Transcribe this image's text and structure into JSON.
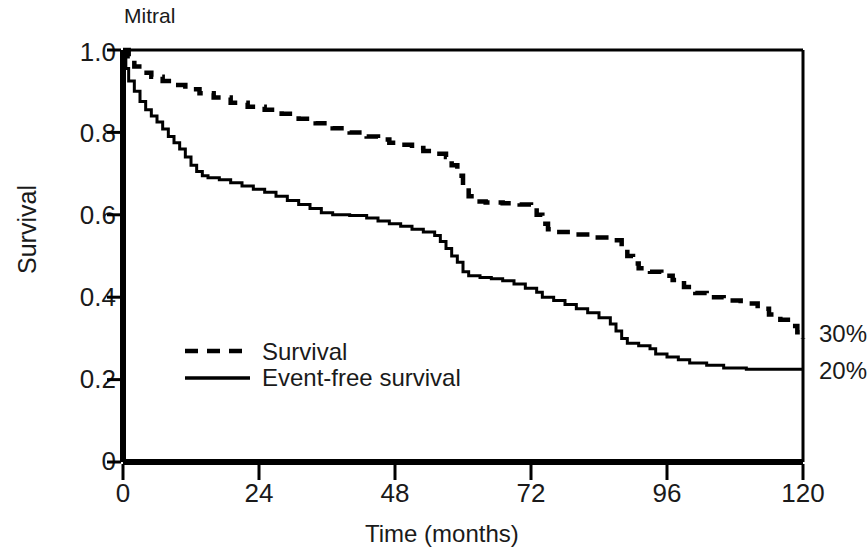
{
  "chart_data": {
    "type": "line",
    "title": "Mitral",
    "xlabel": "Time (months)",
    "ylabel": "Survival",
    "xlim": [
      0,
      120
    ],
    "ylim": [
      0,
      1.0
    ],
    "xticks": [
      "0",
      "24",
      "48",
      "72",
      "96",
      "120"
    ],
    "xtick_values": [
      0,
      24,
      48,
      72,
      96,
      120
    ],
    "yticks": [
      "0",
      "0.2",
      "0.4",
      "0.6",
      "0.8",
      "1.0"
    ],
    "ytick_values": [
      0,
      0.2,
      0.4,
      0.6,
      0.8,
      1.0
    ],
    "grid": false,
    "legend_position": "inside-lower-left",
    "annotations": [
      {
        "text": "30%",
        "series": "Survival",
        "x": 120,
        "y": 0.3
      },
      {
        "text": "20%",
        "series": "Event-free survival",
        "x": 120,
        "y": 0.22
      }
    ],
    "series": [
      {
        "name": "Survival",
        "style": "dashed",
        "color": "#000000",
        "points": [
          [
            0,
            1.0
          ],
          [
            1,
            0.985
          ],
          [
            2,
            0.96
          ],
          [
            3.5,
            0.945
          ],
          [
            5,
            0.935
          ],
          [
            7,
            0.925
          ],
          [
            9,
            0.915
          ],
          [
            11,
            0.905
          ],
          [
            13.5,
            0.895
          ],
          [
            16,
            0.885
          ],
          [
            19,
            0.872
          ],
          [
            22,
            0.862
          ],
          [
            25,
            0.855
          ],
          [
            28,
            0.845
          ],
          [
            31,
            0.833
          ],
          [
            34,
            0.822
          ],
          [
            37,
            0.81
          ],
          [
            40,
            0.8
          ],
          [
            43,
            0.79
          ],
          [
            45,
            0.783
          ],
          [
            47,
            0.775
          ],
          [
            49,
            0.77
          ],
          [
            51,
            0.762
          ],
          [
            53,
            0.755
          ],
          [
            55,
            0.748
          ],
          [
            57,
            0.74
          ],
          [
            58,
            0.72
          ],
          [
            59,
            0.695
          ],
          [
            60,
            0.672
          ],
          [
            61,
            0.645
          ],
          [
            62,
            0.632
          ],
          [
            64,
            0.63
          ],
          [
            67,
            0.628
          ],
          [
            70,
            0.625
          ],
          [
            72,
            0.623
          ],
          [
            73,
            0.6
          ],
          [
            74,
            0.578
          ],
          [
            75,
            0.565
          ],
          [
            77,
            0.558
          ],
          [
            80,
            0.552
          ],
          [
            83,
            0.545
          ],
          [
            86,
            0.538
          ],
          [
            88,
            0.52
          ],
          [
            89,
            0.5
          ],
          [
            90,
            0.482
          ],
          [
            91,
            0.47
          ],
          [
            93,
            0.462
          ],
          [
            95,
            0.452
          ],
          [
            97,
            0.442
          ],
          [
            99,
            0.425
          ],
          [
            101,
            0.41
          ],
          [
            103,
            0.4
          ],
          [
            106,
            0.392
          ],
          [
            109,
            0.385
          ],
          [
            112,
            0.372
          ],
          [
            114,
            0.358
          ],
          [
            116,
            0.345
          ],
          [
            118,
            0.33
          ],
          [
            119,
            0.315
          ],
          [
            120,
            0.3
          ]
        ]
      },
      {
        "name": "Event-free survival",
        "style": "solid",
        "color": "#000000",
        "points": [
          [
            0,
            1.0
          ],
          [
            0.5,
            0.955
          ],
          [
            1,
            0.925
          ],
          [
            2,
            0.9
          ],
          [
            3,
            0.875
          ],
          [
            4,
            0.855
          ],
          [
            5,
            0.84
          ],
          [
            6,
            0.825
          ],
          [
            7,
            0.808
          ],
          [
            8,
            0.79
          ],
          [
            9,
            0.775
          ],
          [
            10,
            0.76
          ],
          [
            11,
            0.74
          ],
          [
            12,
            0.72
          ],
          [
            13,
            0.705
          ],
          [
            14,
            0.695
          ],
          [
            15,
            0.69
          ],
          [
            17,
            0.685
          ],
          [
            19,
            0.678
          ],
          [
            21,
            0.67
          ],
          [
            23,
            0.662
          ],
          [
            25,
            0.655
          ],
          [
            27,
            0.645
          ],
          [
            29,
            0.635
          ],
          [
            31,
            0.625
          ],
          [
            33,
            0.615
          ],
          [
            35,
            0.605
          ],
          [
            37,
            0.6
          ],
          [
            40,
            0.598
          ],
          [
            43,
            0.592
          ],
          [
            45,
            0.585
          ],
          [
            47,
            0.578
          ],
          [
            49,
            0.572
          ],
          [
            51,
            0.565
          ],
          [
            53,
            0.558
          ],
          [
            55,
            0.55
          ],
          [
            56,
            0.535
          ],
          [
            57,
            0.518
          ],
          [
            58,
            0.5
          ],
          [
            59,
            0.485
          ],
          [
            60,
            0.462
          ],
          [
            61,
            0.452
          ],
          [
            63,
            0.448
          ],
          [
            65,
            0.445
          ],
          [
            67,
            0.44
          ],
          [
            69,
            0.432
          ],
          [
            71,
            0.422
          ],
          [
            73,
            0.412
          ],
          [
            74,
            0.4
          ],
          [
            76,
            0.392
          ],
          [
            78,
            0.382
          ],
          [
            80,
            0.372
          ],
          [
            82,
            0.362
          ],
          [
            84,
            0.35
          ],
          [
            86,
            0.335
          ],
          [
            87,
            0.318
          ],
          [
            88,
            0.3
          ],
          [
            89,
            0.288
          ],
          [
            91,
            0.282
          ],
          [
            93,
            0.275
          ],
          [
            94,
            0.262
          ],
          [
            96,
            0.255
          ],
          [
            98,
            0.248
          ],
          [
            100,
            0.24
          ],
          [
            103,
            0.235
          ],
          [
            106,
            0.228
          ],
          [
            110,
            0.225
          ],
          [
            120,
            0.225
          ]
        ]
      }
    ]
  },
  "axes": {
    "ytick_labels": [
      "1.0",
      "0.8",
      "0.6",
      "0.4",
      "0.2",
      "0"
    ],
    "xtick_labels": [
      "0",
      "24",
      "48",
      "72",
      "96",
      "120"
    ]
  },
  "legend": {
    "survival_label": "Survival",
    "eventfree_label": "Event-free survival"
  },
  "endpoints": {
    "survival_pct": "30%",
    "eventfree_pct": "20%"
  }
}
